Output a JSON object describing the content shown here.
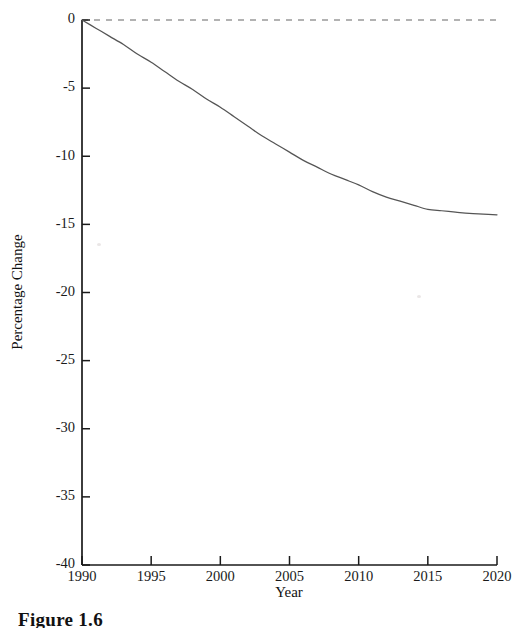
{
  "figure": {
    "caption": "Figure 1.6"
  },
  "chart_data": {
    "type": "line",
    "title": "",
    "subtitle": "",
    "xlabel": "Year",
    "ylabel": "Percentage Change",
    "xlim": [
      1990,
      2020
    ],
    "ylim": [
      -40,
      0
    ],
    "xticks": [
      1990,
      1995,
      2000,
      2005,
      2010,
      2015,
      2020
    ],
    "xticklabels": [
      "1990",
      "1995",
      "2000",
      "2005",
      "2010",
      "2015",
      "2020"
    ],
    "yticks": [
      0,
      -5,
      -10,
      -15,
      -20,
      -25,
      -30,
      -35,
      -40
    ],
    "yticklabels": [
      "0",
      "-5",
      "-10",
      "-15",
      "-20",
      "-25",
      "-30",
      "-35",
      "-40"
    ],
    "grid": false,
    "legend": null,
    "legend_position": "none",
    "series": [
      {
        "name": "Percentage Change",
        "style": "solid",
        "color": "#555555",
        "x": [
          1990,
          1991,
          1992,
          1993,
          1994,
          1995,
          1996,
          1997,
          1998,
          1999,
          2000,
          2001,
          2002,
          2003,
          2004,
          2005,
          2006,
          2007,
          2008,
          2009,
          2010,
          2011,
          2012,
          2013,
          2014,
          2015,
          2016,
          2017,
          2018,
          2019,
          2020
        ],
        "values": [
          0.0,
          -0.6,
          -1.2,
          -1.8,
          -2.5,
          -3.1,
          -3.8,
          -4.5,
          -5.1,
          -5.8,
          -6.4,
          -7.1,
          -7.8,
          -8.5,
          -9.1,
          -9.7,
          -10.3,
          -10.8,
          -11.3,
          -11.7,
          -12.1,
          -12.6,
          -13.0,
          -13.3,
          -13.6,
          -13.9,
          -14.0,
          -14.1,
          -14.2,
          -14.25,
          -14.3
        ]
      },
      {
        "name": "zero-reference",
        "style": "dashed",
        "color": "#999999",
        "x": [
          1990,
          2020
        ],
        "values": [
          0,
          0
        ]
      }
    ],
    "annotations": []
  },
  "axes": {
    "y_axis_name": "percentage-change-axis",
    "x_axis_name": "year-axis"
  }
}
